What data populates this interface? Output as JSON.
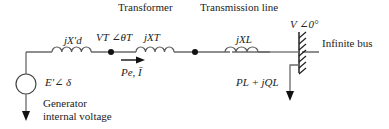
{
  "labels": {
    "transformer": "Transformer",
    "transmission_line": "Transmission line",
    "infinite_bus": "Infinite bus",
    "generator_line1": "Generator",
    "generator_line2": "internal voltage"
  },
  "symbols": {
    "gen_reactance": "jX′d",
    "terminal_voltage": "VT ∠θT",
    "transformer_reactance": "jXT",
    "line_reactance": "jXL",
    "bus_voltage": "V ∠0°",
    "gen_emf": "E′∠ δ",
    "power_current": "Pe, Ī",
    "load_power": "PL + jQL"
  },
  "colors": {
    "wire": "#6a6a6a",
    "text": "#222222"
  }
}
